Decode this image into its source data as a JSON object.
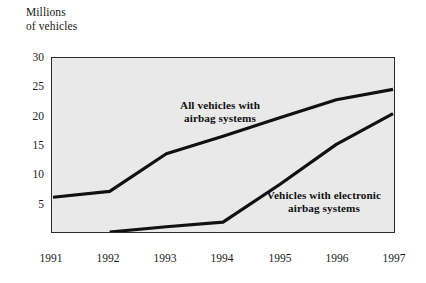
{
  "axis_caption": "Millions\nof vehicles",
  "chart_data": {
    "type": "line",
    "title": "",
    "xlabel": "",
    "ylabel": "Millions of vehicles",
    "x": [
      "1991",
      "1992",
      "1993",
      "1994",
      "1995",
      "1996",
      "1997"
    ],
    "xlim": [
      1991,
      1997
    ],
    "ylim": [
      0,
      30
    ],
    "yticks": [
      5,
      10,
      15,
      20,
      25,
      30
    ],
    "grid": false,
    "legend_position": "inline-annotations",
    "background": "#e9e9e9",
    "line_color": "#000000",
    "series": [
      {
        "name": "All vehicles with airbag systems",
        "values": [
          6,
          7,
          13.5,
          16.5,
          19.7,
          22.8,
          24.6
        ]
      },
      {
        "name": "Vehicles with electronic airbag systems",
        "values": [
          null,
          0,
          0.9,
          1.7,
          8.2,
          15.1,
          20.4
        ]
      }
    ],
    "annotations": [
      {
        "text": "All vehicles with\nairbag systems",
        "series": "All vehicles with airbag systems"
      },
      {
        "text": "Vehicles with electronic\nairbag systems",
        "series": "Vehicles with electronic airbag systems"
      }
    ]
  },
  "y_tick_labels": [
    "30",
    "25",
    "20",
    "15",
    "10",
    "5"
  ],
  "x_tick_labels": [
    "1991",
    "1992",
    "1993",
    "1994",
    "1995",
    "1996",
    "1997"
  ],
  "labels": {
    "all_vehicles": "All vehicles with\nairbag systems",
    "electronic": "Vehicles with electronic\nairbag systems"
  }
}
